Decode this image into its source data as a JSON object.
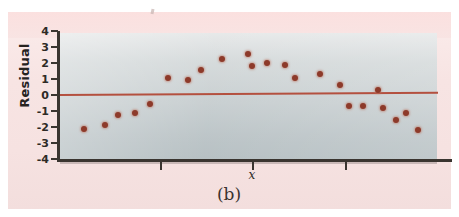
{
  "figure": {
    "caption": "(b)",
    "top_speck": "scanner-speck"
  },
  "chart_data": {
    "type": "scatter",
    "title": "",
    "subtitle": "",
    "xlabel": "x",
    "ylabel": "Residual",
    "grid": false,
    "legend": null,
    "ylim": [
      -4,
      4
    ],
    "yticks": [
      4,
      3,
      2,
      1,
      0,
      -1,
      -2,
      -3,
      -4
    ],
    "ytick_labels": [
      "4",
      "3",
      "2",
      "1",
      "0",
      "-1",
      "-2",
      "-3",
      "-4"
    ],
    "xticks_unlabeled": 3,
    "reference_line": {
      "name": "zero-residual-line",
      "y": 0,
      "color": "#b4503f"
    },
    "point_color": "#8d3a2a",
    "plot_background": "#c6cdcf",
    "page_background": "#f6e2e1",
    "points": [
      {
        "x_px": 84,
        "y": -2.15
      },
      {
        "x_px": 105,
        "y": -1.9
      },
      {
        "x_px": 118,
        "y": -1.25
      },
      {
        "x_px": 135,
        "y": -1.15
      },
      {
        "x_px": 150,
        "y": -0.55
      },
      {
        "x_px": 168,
        "y": 1.1
      },
      {
        "x_px": 188,
        "y": 0.95
      },
      {
        "x_px": 201,
        "y": 1.6
      },
      {
        "x_px": 222,
        "y": 2.25
      },
      {
        "x_px": 248,
        "y": 2.55
      },
      {
        "x_px": 252,
        "y": 1.8
      },
      {
        "x_px": 267,
        "y": 2.0
      },
      {
        "x_px": 285,
        "y": 1.9
      },
      {
        "x_px": 295,
        "y": 1.1
      },
      {
        "x_px": 320,
        "y": 1.3
      },
      {
        "x_px": 340,
        "y": 0.6
      },
      {
        "x_px": 349,
        "y": -0.7
      },
      {
        "x_px": 363,
        "y": -0.7
      },
      {
        "x_px": 378,
        "y": 0.3
      },
      {
        "x_px": 383,
        "y": -0.8
      },
      {
        "x_px": 396,
        "y": -1.55
      },
      {
        "x_px": 406,
        "y": -1.15
      },
      {
        "x_px": 418,
        "y": -2.2
      }
    ]
  },
  "axes_geometry": {
    "plot_left_px": 60,
    "plot_right_px": 437,
    "y_zero_px": 95,
    "px_per_unit": 15.9,
    "x_tick_px": [
      160,
      252,
      345
    ]
  }
}
